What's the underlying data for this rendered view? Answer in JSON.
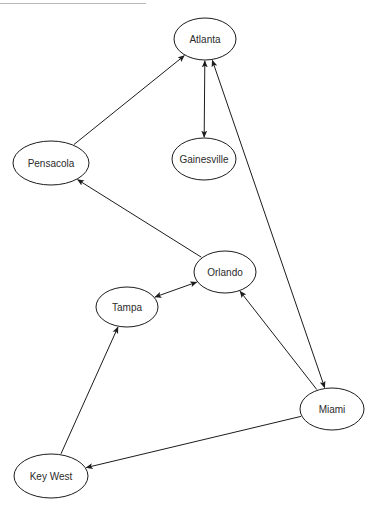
{
  "diagram": {
    "background_color": "#ffffff",
    "stroke_color": "#1c1c1c",
    "label_color": "#2b2b2b",
    "rule_color": "#b7b7b7",
    "width": 371,
    "height": 513,
    "top_rule": {
      "x": 0,
      "y": 3,
      "width": 146
    },
    "nodes": [
      {
        "id": "atlanta",
        "label": "Atlanta",
        "cx": 205,
        "cy": 39,
        "rx": 31,
        "ry": 21
      },
      {
        "id": "pensacola",
        "label": "Pensacola",
        "cx": 51,
        "cy": 163,
        "rx": 38,
        "ry": 22
      },
      {
        "id": "gainesville",
        "label": "Gainesville",
        "cx": 204,
        "cy": 159,
        "rx": 32,
        "ry": 21
      },
      {
        "id": "orlando",
        "label": "Orlando",
        "cx": 225,
        "cy": 272,
        "rx": 31,
        "ry": 21
      },
      {
        "id": "tampa",
        "label": "Tampa",
        "cx": 127,
        "cy": 307,
        "rx": 31,
        "ry": 20
      },
      {
        "id": "miami",
        "label": "Miami",
        "cx": 332,
        "cy": 409,
        "rx": 32,
        "ry": 21
      },
      {
        "id": "keywest",
        "label": "Key West",
        "cx": 51,
        "cy": 476,
        "rx": 37,
        "ry": 22
      }
    ],
    "edges": [
      {
        "id": "pensacola-atlanta",
        "from": "pensacola",
        "to": "atlanta",
        "direction": "forward",
        "label": "Pensacola to Atlanta"
      },
      {
        "id": "atlanta-gainesville",
        "from": "atlanta",
        "to": "gainesville",
        "direction": "bidirectional",
        "label": "Atlanta and Gainesville"
      },
      {
        "id": "atlanta-miami",
        "from": "atlanta",
        "to": "miami",
        "direction": "bidirectional",
        "label": "Atlanta and Miami"
      },
      {
        "id": "orlando-pensacola",
        "from": "orlando",
        "to": "pensacola",
        "direction": "forward",
        "label": "Orlando to Pensacola"
      },
      {
        "id": "tampa-orlando",
        "from": "tampa",
        "to": "orlando",
        "direction": "bidirectional",
        "label": "Tampa and Orlando"
      },
      {
        "id": "miami-orlando",
        "from": "miami",
        "to": "orlando",
        "direction": "forward",
        "label": "Miami to Orlando"
      },
      {
        "id": "miami-keywest",
        "from": "miami",
        "to": "keywest",
        "direction": "forward",
        "label": "Miami to Key West"
      },
      {
        "id": "keywest-tampa",
        "from": "keywest",
        "to": "tampa",
        "direction": "forward",
        "label": "Key West to Tampa"
      }
    ]
  }
}
